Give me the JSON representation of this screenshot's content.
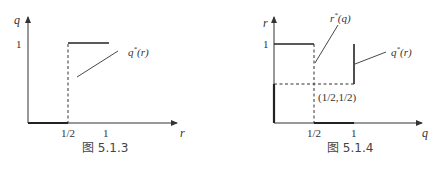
{
  "figures": [
    {
      "caption": "图 5.1.3",
      "y_axis_label": "q",
      "x_axis_label": "r",
      "y_tick_labels": [
        "1"
      ],
      "x_tick_labels": [
        "1/2",
        "1"
      ],
      "curve_labels": [
        "q*(r)"
      ],
      "curve_label_base": "q",
      "curve_label_sup": "*",
      "curve_label_arg": "(r)"
    },
    {
      "caption": "图 5.1.4",
      "y_axis_label": "r",
      "x_axis_label": "q",
      "y_tick_labels": [
        "1"
      ],
      "x_tick_labels": [
        "1/2",
        "1"
      ],
      "curve_labels": [
        "r*(q)",
        "q*(r)"
      ],
      "curve1_base": "r",
      "curve1_sup": "*",
      "curve1_arg": "(q)",
      "curve2_base": "q",
      "curve2_sup": "*",
      "curve2_arg": "(r)",
      "point_label": "(1/2,1/2)"
    }
  ],
  "colors": {
    "line": "#333333",
    "text": "#333333"
  }
}
